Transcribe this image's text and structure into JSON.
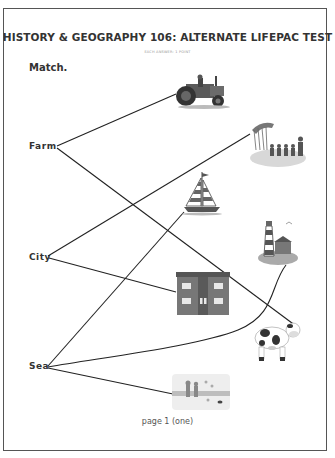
{
  "document": {
    "title": "HISTORY & GEOGRAPHY 106: ALTERNATE LIFEPAC TEST",
    "subtitle": "EACH ANSWER: 1 POINT",
    "instruction": "Match.",
    "footer": "page 1 (one)"
  },
  "words": [
    {
      "label": "Farm"
    },
    {
      "label": "City"
    },
    {
      "label": "Sea"
    }
  ],
  "pictures": [
    {
      "name": "tractor"
    },
    {
      "name": "parade"
    },
    {
      "name": "sailboat"
    },
    {
      "name": "lighthouse"
    },
    {
      "name": "apartment-building"
    },
    {
      "name": "cow"
    },
    {
      "name": "beach-children"
    }
  ],
  "matches": [
    {
      "from": "Farm",
      "to": "tractor"
    },
    {
      "from": "Farm",
      "to": "cow"
    },
    {
      "from": "City",
      "to": "parade"
    },
    {
      "from": "City",
      "to": "apartment-building"
    },
    {
      "from": "Sea",
      "to": "sailboat"
    },
    {
      "from": "Sea",
      "to": "lighthouse"
    },
    {
      "from": "Sea",
      "to": "beach-children"
    }
  ],
  "colors": {
    "border": "#555555",
    "text": "#333333",
    "line": "#222222"
  }
}
